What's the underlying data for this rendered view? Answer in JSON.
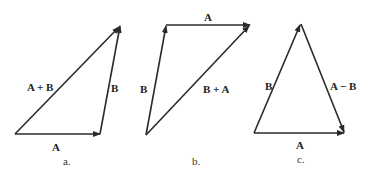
{
  "panels": [
    {
      "caption": "a.",
      "labels": {
        "bottom": "A",
        "right": "B",
        "diagonal": "A + B"
      }
    },
    {
      "caption": "b.",
      "labels": {
        "top": "A",
        "left": "B",
        "diagonal": "B + A"
      }
    },
    {
      "caption": "c.",
      "labels": {
        "bottom": "A",
        "left": "B",
        "right": "A − B"
      }
    }
  ],
  "colors": {
    "stroke": "#2a2a2a",
    "text": "#222222",
    "background": "#ffffff"
  }
}
